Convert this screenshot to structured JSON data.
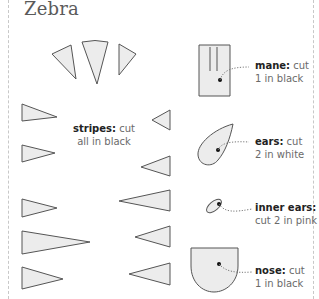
{
  "title": "Zebra",
  "colors": {
    "piece_fill": "#ececec",
    "piece_stroke": "#555555",
    "text": "#6a6a6a",
    "bold_text": "#222222",
    "frame": "#c8c8c8"
  },
  "labels": {
    "mane": {
      "name": "mane:",
      "line1_rest": " cut",
      "line2": "1 in black"
    },
    "stripes": {
      "name": "stripes:",
      "line1_rest": " cut",
      "line2": "all in black"
    },
    "ears": {
      "name": "ears:",
      "line1_rest": " cut",
      "line2": "2 in white"
    },
    "inner_ears": {
      "name": "inner ears:",
      "line2": "cut 2 in pink"
    },
    "nose": {
      "name": "nose:",
      "line1_rest": " cut",
      "line2": "1 in black"
    }
  }
}
